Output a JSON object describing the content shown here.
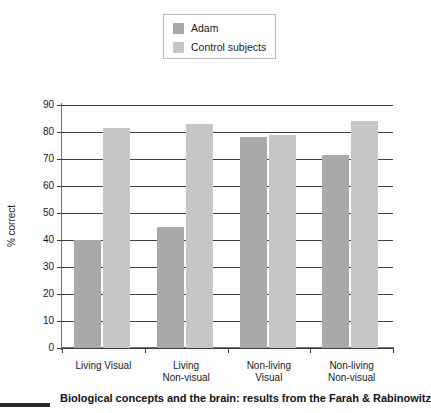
{
  "legend": {
    "entries": [
      {
        "label": "Adam",
        "color": "#a9a9a9"
      },
      {
        "label": "Control subjects",
        "color": "#c6c6c6"
      }
    ]
  },
  "axes": {
    "ylabel": "% correct",
    "yticks": [
      "0",
      "10",
      "20",
      "30",
      "40",
      "50",
      "60",
      "70",
      "80",
      "90"
    ]
  },
  "caption": {
    "text": "Biological concepts and the brain: results from the Farah & Rabinowitz"
  },
  "chart_data": {
    "type": "bar",
    "title": "",
    "xlabel": "",
    "ylabel": "% correct",
    "ylim": [
      0,
      90
    ],
    "ytick_step": 10,
    "grid": true,
    "legend_position": "top-center",
    "categories": [
      "Living Visual",
      "Living Non-visual",
      "Non-living Visual",
      "Non-living Non-visual"
    ],
    "category_lines": [
      [
        "Living Visual",
        ""
      ],
      [
        "Living",
        "Non-visual"
      ],
      [
        "Non-living",
        "Visual"
      ],
      [
        "Non-living",
        "Non-visual"
      ]
    ],
    "series": [
      {
        "name": "Adam",
        "color": "#a9a9a9",
        "values": [
          40,
          45,
          78,
          71.5
        ]
      },
      {
        "name": "Control subjects",
        "color": "#c6c6c6",
        "values": [
          81.5,
          83,
          79,
          84
        ]
      }
    ]
  }
}
